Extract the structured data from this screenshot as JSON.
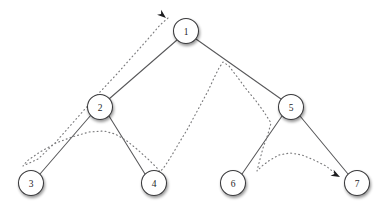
{
  "diagram": {
    "width": 382,
    "height": 218,
    "background_color": "#ffffff",
    "node_fill_color": "#ffffff",
    "node_stroke_color": "#3a3a3c",
    "edge_color": "#58585a",
    "traversal_color": "#7b7b7d",
    "arrow_color": "#1d1d1f",
    "node_radius": 12.5,
    "nodes": [
      {
        "id": "n1",
        "label": "1",
        "cx": 186,
        "cy": 31,
        "level": 0
      },
      {
        "id": "n2",
        "label": "2",
        "cx": 100,
        "cy": 107,
        "level": 1
      },
      {
        "id": "n5",
        "label": "5",
        "cx": 291,
        "cy": 107,
        "level": 1
      },
      {
        "id": "n3",
        "label": "3",
        "cx": 31,
        "cy": 183,
        "level": 2
      },
      {
        "id": "n4",
        "label": "4",
        "cx": 154,
        "cy": 183,
        "level": 2
      },
      {
        "id": "n6",
        "label": "6",
        "cx": 233,
        "cy": 183,
        "level": 2
      },
      {
        "id": "n7",
        "label": "7",
        "cx": 357,
        "cy": 183,
        "level": 2
      }
    ],
    "edges": [
      {
        "id": "e1",
        "from": "n1",
        "to": "n2",
        "x1": 177,
        "y1": 40,
        "x2": 109,
        "y2": 99
      },
      {
        "id": "e2",
        "from": "n1",
        "to": "n5",
        "x1": 196,
        "y1": 39,
        "x2": 281,
        "y2": 99
      },
      {
        "id": "e3",
        "from": "n2",
        "to": "n3",
        "x1": 91,
        "y1": 115,
        "x2": 40,
        "y2": 174
      },
      {
        "id": "e4",
        "from": "n2",
        "to": "n4",
        "x1": 109,
        "y1": 116,
        "x2": 145,
        "y2": 174
      },
      {
        "id": "e5",
        "from": "n5",
        "to": "n6",
        "x1": 282,
        "y1": 116,
        "x2": 242,
        "y2": 174
      },
      {
        "id": "e6",
        "from": "n5",
        "to": "n7",
        "x1": 300,
        "y1": 116,
        "x2": 348,
        "y2": 174
      }
    ],
    "traversal": {
      "name": "euler-tour-path",
      "style": "dotted",
      "points": "168,18 160,25 148,39 131,58 116,75 100,92 85,109 70,126 55,143 38,159 23,166 27,161 40,152 56,143 72,137 89,132 104,131 115,134 127,141 138,150 149,160 157,168 160,172 165,166 172,155 179,143 187,130 194,117 201,104 208,91 214,78 219,68 223,62 229,66 238,78 247,90 256,101 264,112 271,123 268,134 263,148 259,163 257,171 262,166 270,160 279,155 290,153 302,155 314,160 326,166 336,174",
      "start_arrow": {
        "x": 166,
        "y": 18,
        "angle": -140
      },
      "end_arrow": {
        "x": 340,
        "y": 177,
        "angle": 28
      }
    }
  }
}
